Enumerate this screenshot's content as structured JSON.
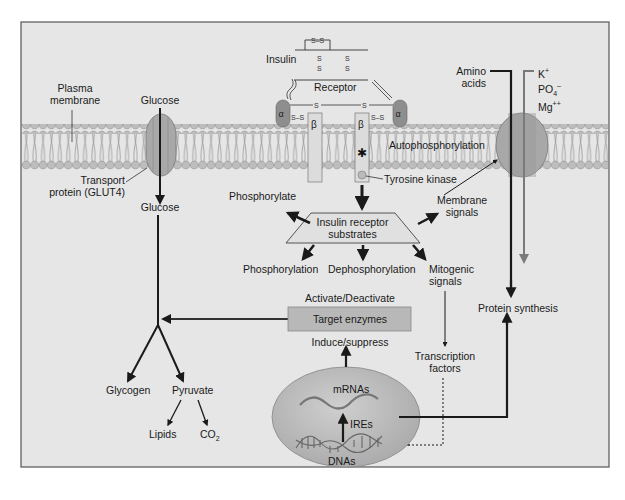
{
  "diagram": {
    "colors": {
      "background": "#e6e6e6",
      "frame": "#555555",
      "membrane_head": "#bdbdbd",
      "membrane_tail": "#8a8a8a",
      "protein": "#a8a8a8",
      "alpha_subunit": "#8e8e8e",
      "beta_subunit": "#dcdcdc",
      "target_box": "#b8b8b8",
      "nucleus": "#b5b5b5",
      "arrow_dark": "#1a1a1a",
      "arrow_gray": "#7a7a7a"
    },
    "labels": {
      "plasma_membrane": [
        "Plasma",
        "membrane"
      ],
      "glucose_top": "Glucose",
      "transport_protein": [
        "Transport",
        "protein (GLUT4)"
      ],
      "glucose_bottom": "Glucose",
      "insulin": "Insulin",
      "receptor": "Receptor",
      "alpha": "α",
      "beta": "β",
      "ss": "S–S",
      "s": "S",
      "autophosphorylation": "Autophosphorylation",
      "tyrosine_kinase": "Tyrosine kinase",
      "phosphorylate": "Phosphorylate",
      "irs": [
        "Insulin receptor",
        "substrates"
      ],
      "membrane_signals": [
        "Membrane",
        "signals"
      ],
      "phosphorylation": "Phosphorylation",
      "dephosphorylation": "Dephosphorylation",
      "mitogenic_signals": [
        "Mitogenic",
        "signals"
      ],
      "activate_deactivate": "Activate/Deactivate",
      "target_enzymes": "Target enzymes",
      "induce_suppress": "Induce/suppress",
      "transcription_factors": [
        "Transcription",
        "factors"
      ],
      "mrnas": "mRNAs",
      "ires": "IREs",
      "dnas": "DNAs",
      "glycogen": "Glycogen",
      "pyruvate": "Pyruvate",
      "lipids": "Lipids",
      "co2": "CO",
      "co2_sub": "2",
      "amino_acids": [
        "Amino",
        "acids"
      ],
      "k": "K",
      "k_sup": "+",
      "po4": "PO",
      "po4_sub": "4",
      "po4_sup": "–",
      "mg": "Mg",
      "mg_sup": "++",
      "protein_synthesis": "Protein synthesis"
    }
  }
}
